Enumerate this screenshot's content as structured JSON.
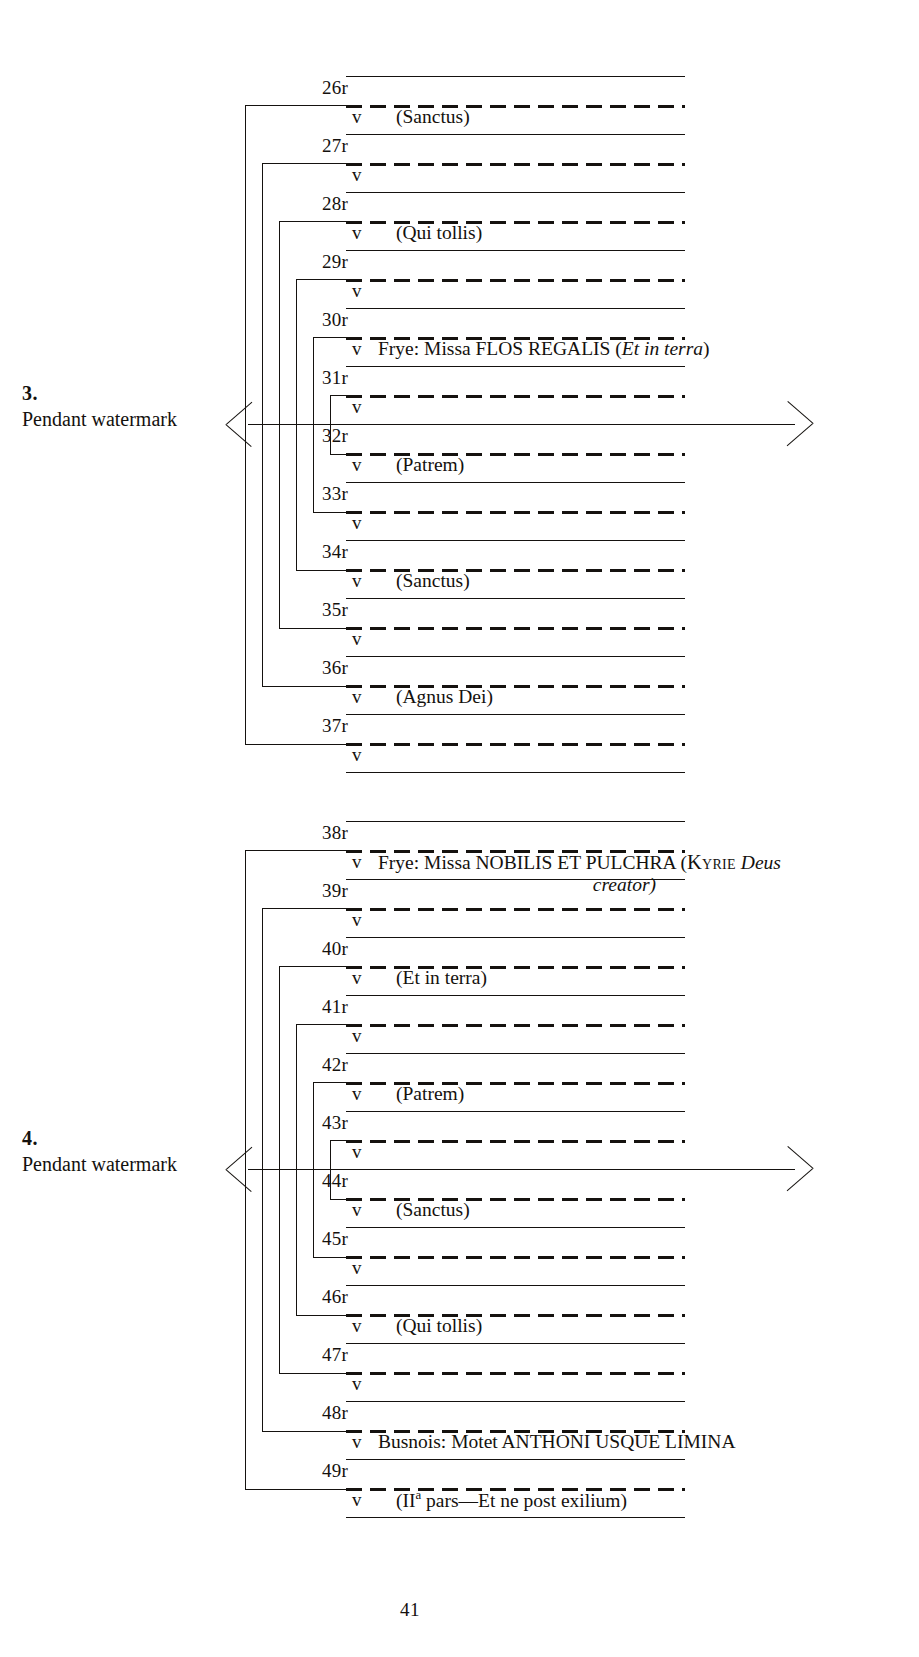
{
  "page": {
    "page_number": "41",
    "page_number_x": 400,
    "page_number_y": 1599
  },
  "quires": [
    {
      "id": "quire-3",
      "watermark_number": "3.",
      "watermark_label": "Pendant watermark",
      "top": 76,
      "row_height": 58,
      "watermark_row_index": 5,
      "folios": [
        {
          "recto": "26r",
          "verso": "v",
          "entry": "(Sanctus)",
          "indent": true
        },
        {
          "recto": "27r",
          "verso": "v",
          "entry": ""
        },
        {
          "recto": "28r",
          "verso": "v",
          "entry": "(Qui tollis)",
          "indent": true
        },
        {
          "recto": "29r",
          "verso": "v",
          "entry": ""
        },
        {
          "recto": "30r",
          "verso": "v",
          "entry": "Frye: Missa FLOS REGALIS (Et in terra)",
          "entry_rich": true
        },
        {
          "recto": "31r",
          "verso": "v",
          "entry": ""
        },
        {
          "recto": "32r",
          "verso": "v",
          "entry": "(Patrem)",
          "indent": true
        },
        {
          "recto": "33r",
          "verso": "v",
          "entry": ""
        },
        {
          "recto": "34r",
          "verso": "v",
          "entry": "(Sanctus)",
          "indent": true
        },
        {
          "recto": "35r",
          "verso": "v",
          "entry": ""
        },
        {
          "recto": "36r",
          "verso": "v",
          "entry": "(Agnus Dei)",
          "indent": true
        },
        {
          "recto": "37r",
          "verso": "v",
          "entry": ""
        }
      ],
      "bifolia": [
        {
          "outer": 0,
          "inner": 11
        },
        {
          "outer": 1,
          "inner": 10
        },
        {
          "outer": 2,
          "inner": 9
        },
        {
          "outer": 3,
          "inner": 8
        },
        {
          "outer": 4,
          "inner": 7
        },
        {
          "outer": 5,
          "inner": 6
        }
      ]
    },
    {
      "id": "quire-4",
      "watermark_number": "4.",
      "watermark_label": "Pendant watermark",
      "top": 821,
      "row_height": 58,
      "watermark_row_index": 5,
      "folios": [
        {
          "recto": "38r",
          "verso": "v",
          "entry": "Frye: Missa NOBILIS ET PULCHRA (KYRIE Deus creator)",
          "entry_rich": true
        },
        {
          "recto": "39r",
          "verso": "v",
          "entry": ""
        },
        {
          "recto": "40r",
          "verso": "v",
          "entry": "(Et in terra)",
          "indent": true
        },
        {
          "recto": "41r",
          "verso": "v",
          "entry": ""
        },
        {
          "recto": "42r",
          "verso": "v",
          "entry": "(Patrem)",
          "indent": true
        },
        {
          "recto": "43r",
          "verso": "v",
          "entry": ""
        },
        {
          "recto": "44r",
          "verso": "v",
          "entry": "(Sanctus)",
          "indent": true
        },
        {
          "recto": "45r",
          "verso": "v",
          "entry": ""
        },
        {
          "recto": "46r",
          "verso": "v",
          "entry": "(Qui tollis)",
          "indent": true
        },
        {
          "recto": "47r",
          "verso": "v",
          "entry": ""
        },
        {
          "recto": "48r",
          "verso": "v",
          "entry": "Busnois: Motet ANTHONI USQUE LIMINA"
        },
        {
          "recto": "49r",
          "verso": "v",
          "entry": "(IIa pars—Et ne post exilium)",
          "indent": true
        }
      ],
      "bifolia": [
        {
          "outer": 0,
          "inner": 11
        },
        {
          "outer": 1,
          "inner": 10
        },
        {
          "outer": 2,
          "inner": 9
        },
        {
          "outer": 3,
          "inner": 8
        },
        {
          "outer": 4,
          "inner": 7
        },
        {
          "outer": 5,
          "inner": 6
        }
      ]
    }
  ],
  "entries_rich": {
    "flos_regalis": {
      "composer": "Frye: Missa ",
      "title": "FLOS REGALIS",
      "paren_open": " (",
      "incipit_italic": "Et in terra",
      "paren_close": ")"
    },
    "nobilis_et_pulchra": {
      "composer": "Frye: Missa ",
      "title": "NOBILIS ET PULCHRA",
      "paren_open": " (",
      "smallcaps": "Kyrie",
      "incipit_italic": " Deus",
      "continuation_italic": "creator",
      "paren_close": ")"
    },
    "anthoni": {
      "composer": "Busnois: Motet ",
      "title": "ANTHONI USQUE LIMINA"
    },
    "secunda_pars": {
      "open": "(II",
      "sup": "a",
      "rest": " pars—Et ne post exilium)"
    }
  },
  "colors": {
    "ink": "#15120f",
    "paper": "#ffffff"
  }
}
